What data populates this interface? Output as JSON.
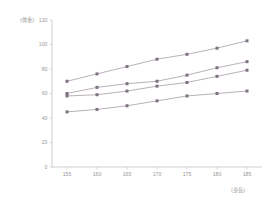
{
  "chart_data": {
    "type": "line",
    "title": "",
    "subtitle": "",
    "xlabel": "(身長)",
    "ylabel": "(体重)",
    "xlim": [
      152.5,
      187.5
    ],
    "ylim": [
      0,
      120
    ],
    "grid": false,
    "legend": "none",
    "x": [
      155,
      160,
      165,
      170,
      175,
      180,
      185
    ],
    "xticks": [
      "155",
      "160",
      "165",
      "170",
      "175",
      "180",
      "185"
    ],
    "yticks": [
      "0",
      "20",
      "40",
      "60",
      "80",
      "100",
      "120"
    ],
    "ytick_values": [
      0,
      20,
      40,
      60,
      80,
      100,
      120
    ],
    "marker": "square",
    "series": [
      {
        "name": "series-1",
        "values": [
          70,
          76,
          82,
          88,
          92,
          97,
          103
        ]
      },
      {
        "name": "series-2",
        "values": [
          60,
          65,
          68,
          70,
          75,
          81,
          86
        ]
      },
      {
        "name": "series-3",
        "values": [
          58,
          59,
          62,
          66,
          69,
          74,
          79
        ]
      },
      {
        "name": "series-4",
        "values": [
          45,
          47,
          50,
          54,
          58,
          60,
          62
        ]
      }
    ],
    "colors": {
      "line": "#9a8f9b",
      "marker": "#7d7080",
      "axis": "#b9b9b9",
      "text": "#9a9a9a",
      "background": "#ffffff"
    }
  }
}
